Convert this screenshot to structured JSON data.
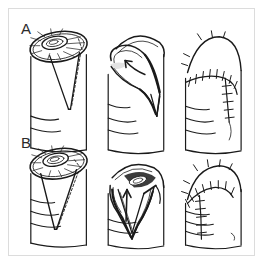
{
  "figure": {
    "kind": "surgical-line-drawing",
    "background_color": "#ffffff",
    "ink_color": "#1a1a1a",
    "frame_color": "#dcdcdc",
    "rows": [
      {
        "label": "A",
        "description": "Single volar V-Y advancement flap",
        "panels": [
          {
            "name": "defect-and-incision",
            "step": 1,
            "caption_text": "",
            "features": [
              "fingertip-defect-ellipse",
              "exposed-nail-bed-hatching",
              "v-shaped-incision-outline",
              "dashed-margin"
            ]
          },
          {
            "name": "flap-advancement",
            "step": 2,
            "caption_text": "",
            "features": [
              "elevated-flap",
              "curved-advancement-arrow",
              "subcutaneous-pedicle"
            ]
          },
          {
            "name": "closure",
            "step": 3,
            "caption_text": "",
            "features": [
              "suture-line",
              "interrupted-sutures",
              "y-shaped-closure"
            ]
          }
        ]
      },
      {
        "label": "B",
        "description": "Long volar V-Y advancement flap",
        "panels": [
          {
            "name": "defect-and-incision",
            "step": 1,
            "caption_text": "",
            "features": [
              "fingertip-defect-ellipse",
              "exposed-nail-bed-hatching",
              "long-v-shaped-incision-outline",
              "dashed-margin"
            ]
          },
          {
            "name": "flap-advancement",
            "step": 2,
            "caption_text": "",
            "features": [
              "elevated-flap",
              "straight-advancement-arrow",
              "subcutaneous-pedicle"
            ]
          },
          {
            "name": "closure",
            "step": 3,
            "caption_text": "",
            "features": [
              "suture-line",
              "interrupted-sutures",
              "y-shaped-closure"
            ]
          }
        ]
      }
    ]
  }
}
